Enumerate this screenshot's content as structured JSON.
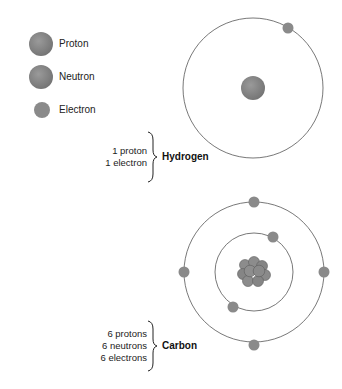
{
  "legend": {
    "items": [
      {
        "label": "Proton",
        "icon": "proton-icon"
      },
      {
        "label": "Neutron",
        "icon": "neutron-icon"
      },
      {
        "label": "Electron",
        "icon": "electron-icon"
      }
    ]
  },
  "atoms": [
    {
      "name": "Hydrogen",
      "counts": [
        "1 proton",
        "1 electron"
      ],
      "shells": [
        {
          "radius": 70,
          "electrons": 1
        }
      ]
    },
    {
      "name": "Carbon",
      "counts": [
        "6 protons",
        "6 neutrons",
        "6 electrons"
      ],
      "shells": [
        {
          "radius": 39,
          "electrons": 2
        },
        {
          "radius": 70,
          "electrons": 4
        }
      ]
    }
  ],
  "colors": {
    "particle": "#858585",
    "particle_dark": "#6e6e6e",
    "orbit": "#555555"
  }
}
